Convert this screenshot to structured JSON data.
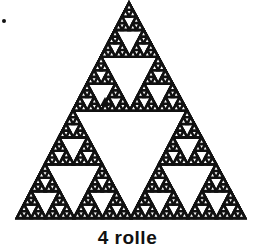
{
  "figure": {
    "type": "sierpinski-triangle",
    "depth": 5,
    "apex": [
      129,
      3
    ],
    "base_left": [
      17,
      218
    ],
    "base_right": [
      245,
      218
    ],
    "stroke_color": "#111111",
    "fill_color": "#ffffff",
    "stroke_width": 2.6,
    "highlight_triangle": {
      "color": "#111111"
    }
  },
  "caption": "4 rolle"
}
